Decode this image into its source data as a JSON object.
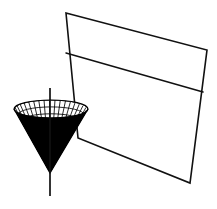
{
  "figure": {
    "title": "3D wireframe cone intersected by a tilted plane",
    "background_color": "#ffffff",
    "line_color": "#111111",
    "mesh_color": "#000000",
    "width": 217,
    "height": 209,
    "caption": ""
  },
  "chart_data": {
    "type": "scatter",
    "subtitle": "",
    "xlabel": "",
    "ylabel": "",
    "zlabel": "",
    "grid": false,
    "legend_position": "none",
    "axes_visible": false,
    "tick_labels": [],
    "annotations": [],
    "objects": [
      {
        "name": "vertical-axis",
        "kind": "line",
        "description": "vertical axis through cone apex",
        "points": [
          [
            50,
            88
          ],
          [
            50,
            196
          ]
        ]
      },
      {
        "name": "cone-surface",
        "kind": "mesh-surface",
        "description": "downward pointing circular cone / funnel drawn as a wireframe mesh, shaded dark on the lower front face",
        "apex": [
          50,
          173
        ],
        "rim_center": [
          51,
          109
        ],
        "rim_radius_x": 37,
        "rim_radius_y": 9,
        "radial_divisions": 24,
        "ring_divisions": 10
      },
      {
        "name": "intersecting-plane",
        "kind": "quadrilateral",
        "description": "tilted planar quadrilateral passing behind and through the cone",
        "corners": [
          [
            66,
            13
          ],
          [
            207,
            50
          ],
          [
            190,
            183
          ],
          [
            78,
            138
          ]
        ]
      },
      {
        "name": "plane-divider-line",
        "kind": "line",
        "description": "horizontal trace line across the plane",
        "points": [
          [
            66,
            53
          ],
          [
            203,
            92
          ]
        ]
      }
    ],
    "categories": [],
    "values": [],
    "x": [],
    "xlim": [
      0,
      217
    ],
    "ylim": [
      0,
      209
    ]
  },
  "elements": {
    "cone_label": "cone-mesh-surface",
    "plane_label": "intersecting-plane",
    "axis_label": "vertical-axis",
    "divider_label": "plane-divider-line"
  }
}
